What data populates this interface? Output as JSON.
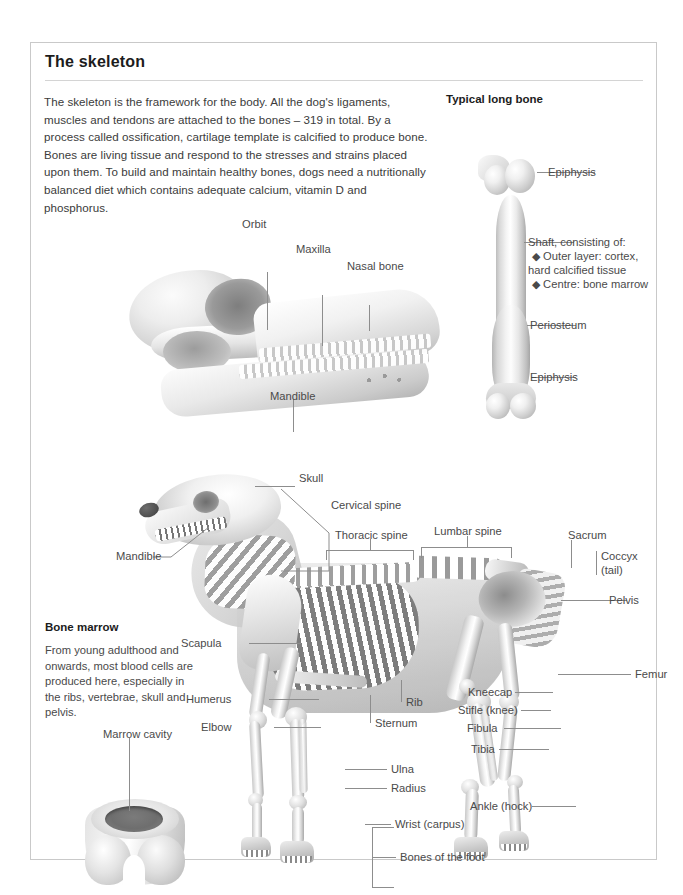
{
  "page": {
    "title": "The skeleton",
    "intro": "The skeleton is the framework for the body. All the dog's ligaments, muscles and tendons are attached to the bones – 319 in total. By a process called ossification, cartilage template is calcified to produce bone. Bones are living tissue and respond to the stresses and strains placed upon them. To build and maintain healthy bones, dogs need a nutritionally balanced diet which contains adequate calcium, vitamin D and phosphorus.",
    "border_color": "#c9c9c9",
    "text_color": "#3b3b3b",
    "label_color": "#4a4a4a",
    "leader_color": "#8d8d8d"
  },
  "long_bone": {
    "heading": "Typical long bone",
    "labels": {
      "epiphysis_top": "Epiphysis",
      "shaft_intro": "Shaft, consisting of:",
      "shaft_bullet_1": "◆ Outer layer:  cortex,",
      "shaft_bullet_1b": "hard calcified tissue",
      "shaft_bullet_2": "◆ Centre: bone marrow",
      "periosteum": "Periosteum",
      "epiphysis_bottom": "Epiphysis"
    }
  },
  "skull": {
    "labels": {
      "orbit": "Orbit",
      "maxilla": "Maxilla",
      "nasal_bone": "Nasal bone",
      "mandible": "Mandible"
    }
  },
  "bone_marrow": {
    "heading": "Bone marrow",
    "body": "From young adulthood and onwards, most blood cells are produced here, especially in the ribs, vertebrae, skull and pelvis.",
    "labels": {
      "marrow_cavity": "Marrow cavity"
    }
  },
  "skeleton": {
    "labels": {
      "skull": "Skull",
      "cervical_spine": "Cervical spine",
      "thoracic_spine": "Thoracic spine",
      "lumbar_spine": "Lumbar spine",
      "sacrum": "Sacrum",
      "coccyx": "Coccyx",
      "coccyx_2": "(tail)",
      "pelvis": "Pelvis",
      "mandible": "Mandible",
      "scapula": "Scapula",
      "humerus": "Humerus",
      "elbow": "Elbow",
      "rib": "Rib",
      "sternum": "Sternum",
      "ulna": "Ulna",
      "radius": "Radius",
      "wrist": "Wrist (carpus)",
      "bones_of_foot": "Bones of the foot",
      "femur": "Femur",
      "kneecap": "Kneecap",
      "stifle": "Stifle (knee)",
      "fibula": "Fibula",
      "tibia": "Tibia",
      "ankle": "Ankle (hock)"
    }
  }
}
